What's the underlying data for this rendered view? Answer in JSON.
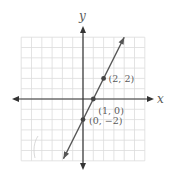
{
  "chart_data": {
    "type": "line",
    "title": "",
    "xlabel": "x",
    "ylabel": "y",
    "xlim": [
      -6,
      6
    ],
    "ylim": [
      -6,
      6
    ],
    "grid": true,
    "equation": "y = 2x - 2",
    "series": [
      {
        "name": "line",
        "x": [
          -1.9,
          4
        ],
        "y": [
          -5.8,
          6
        ],
        "color": "#555555"
      }
    ],
    "points": [
      {
        "x": 2,
        "y": 2,
        "label": "(2, 2)"
      },
      {
        "x": 1,
        "y": 0,
        "label": "(1, 0)"
      },
      {
        "x": 0,
        "y": -2,
        "label": "(0, −2)"
      }
    ]
  },
  "axes": {
    "x_label": "x",
    "y_label": "y"
  },
  "colors": {
    "grid": "#dcdcdc",
    "axis": "#333333",
    "line": "#555555",
    "point": "#444444",
    "text": "#5a5a5a"
  }
}
